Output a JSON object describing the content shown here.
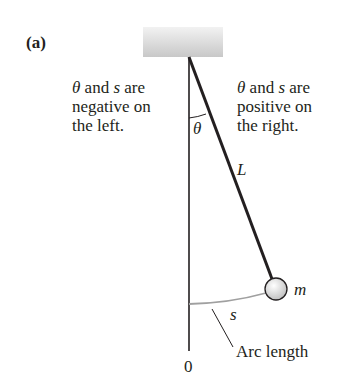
{
  "panel_label": "(a)",
  "left_note": {
    "line1_sym1": "θ",
    "line1_mid": " and ",
    "line1_sym2": "s",
    "line1_end": " are",
    "line2": "negative on",
    "line3": "the left."
  },
  "right_note": {
    "line1_sym1": "θ",
    "line1_mid": " and ",
    "line1_sym2": "s",
    "line1_end": " are",
    "line2": "positive on",
    "line3": "the right."
  },
  "labels": {
    "angle": "θ",
    "length": "L",
    "mass": "m",
    "arc": "s",
    "arc_caption": "Arc length",
    "origin": "0"
  },
  "colors": {
    "ink": "#231f20",
    "ceiling": "#d6d6d6",
    "arc": "#a0a0a0",
    "bob": "#dcdcdc"
  }
}
